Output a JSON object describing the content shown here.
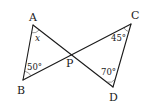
{
  "diagram": {
    "type": "geometry",
    "points": {
      "A": {
        "label": "A",
        "x": 33,
        "y": 25
      },
      "B": {
        "label": "B",
        "x": 23,
        "y": 80
      },
      "C": {
        "label": "C",
        "x": 131,
        "y": 24
      },
      "D": {
        "label": "D",
        "x": 113,
        "y": 87
      },
      "P": {
        "label": "P",
        "x": 71,
        "y": 54
      }
    },
    "segments": [
      {
        "from": "A",
        "to": "B"
      },
      {
        "from": "A",
        "to": "D"
      },
      {
        "from": "B",
        "to": "C"
      },
      {
        "from": "C",
        "to": "D"
      }
    ],
    "angles": {
      "A": {
        "label": "x",
        "vertex": "A"
      },
      "B": {
        "label": "50°",
        "vertex": "B"
      },
      "C": {
        "label": "45°",
        "vertex": "C"
      },
      "D": {
        "label": "70°",
        "vertex": "D"
      }
    }
  }
}
